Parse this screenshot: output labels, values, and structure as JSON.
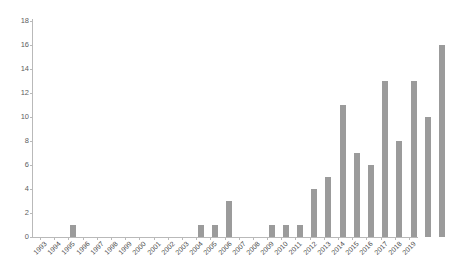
{
  "chart_data": {
    "type": "bar",
    "title": "",
    "subtitle": "",
    "xlabel": "",
    "ylabel": "",
    "categories": [
      "1993",
      "1994",
      "1995",
      "1996",
      "1997",
      "1998",
      "1999",
      "2000",
      "2001",
      "2002",
      "2003",
      "2004",
      "2005",
      "2006",
      "2007",
      "2008",
      "2009",
      "2010",
      "2011",
      "2012",
      "2013",
      "2014",
      "2015",
      "2016",
      "2017",
      "2018",
      "2019"
    ],
    "values": [
      1,
      0,
      0,
      0,
      0,
      0,
      0,
      0,
      0,
      1,
      1,
      3,
      0,
      0,
      1,
      1,
      1,
      4,
      5,
      11,
      7,
      6,
      13,
      8,
      13,
      10,
      16
    ],
    "series": [
      {
        "name": "",
        "values": [
          1,
          0,
          0,
          0,
          0,
          0,
          0,
          0,
          0,
          1,
          1,
          3,
          0,
          0,
          1,
          1,
          1,
          4,
          5,
          11,
          7,
          6,
          13,
          8,
          13,
          10,
          16
        ]
      }
    ],
    "ylim": [
      0,
      18
    ],
    "xlim": [
      0,
      27
    ],
    "y_ticks": [
      0,
      2,
      4,
      6,
      8,
      10,
      12,
      14,
      16,
      18
    ],
    "y_tick_labels": [
      "0",
      "2",
      "4",
      "6",
      "8",
      "10",
      "12",
      "14",
      "16",
      "18"
    ],
    "grid": false,
    "legend": false,
    "legend_position": "none",
    "annotations": [],
    "colors": {
      "bar": "#9b9b9b",
      "axis": "#b9b9b9",
      "tick_label": "#4d4d4d",
      "y_tick_label": "#5e5e5e",
      "background": "#ffffff"
    },
    "x_label_rotation": -45
  }
}
